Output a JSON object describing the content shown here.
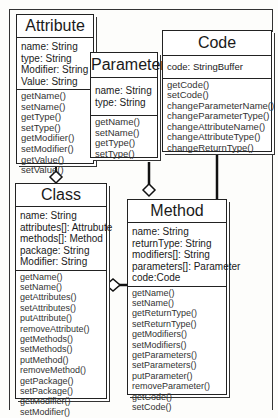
{
  "diagram": {
    "type": "uml-class-diagram",
    "classes": {
      "attribute": {
        "name": "Attribute",
        "attributes": [
          "name: String",
          "type: String",
          "Modifier: String",
          "Value: String"
        ],
        "operations": [
          "getName()",
          "setName()",
          "getType()",
          "setType()",
          "getModifier()",
          "setModifier()",
          "getValue()",
          "setValue()"
        ]
      },
      "parameter": {
        "name": "Parameter",
        "attributes": [
          "name: String",
          "type: String"
        ],
        "operations": [
          "getName()",
          "setName()",
          "getType()",
          "setType()"
        ]
      },
      "code": {
        "name": "Code",
        "attributes": [
          "code: StringBuffer"
        ],
        "operations": [
          "getCode()",
          "setCode()",
          "changeParameterName()",
          "changeParameterType()",
          "changeAttributeName()",
          "changeAttributeType()",
          "changeReturnType()"
        ]
      },
      "class": {
        "name": "Class",
        "attributes": [
          "name: String",
          "attributes[]: Attrubute",
          "methods[]: Method",
          "package: String",
          "Modifier: String"
        ],
        "operations": [
          "getName()",
          "setName()",
          "getAttributes()",
          "setAttributes()",
          "putAttribute()",
          "removeAttribute()",
          "getMethods()",
          "setMethods()",
          "putMethod()",
          "removeMethod()",
          "getPackage()",
          "setPackage()",
          "getModifier()",
          "setModifier()"
        ]
      },
      "method": {
        "name": "Method",
        "attributes": [
          "name: String",
          "returnType: String",
          "modifiers[]: String",
          "parameters[]: Parameter",
          "code:Code"
        ],
        "operations": [
          "getName()",
          "setName()",
          "getReturnType()",
          "setReturnType()",
          "getModifiers()",
          "setModifiers()",
          "getParameters()",
          "setParameters()",
          "putParameter()",
          "removeParameter()",
          "getCode()",
          "setCode()"
        ]
      }
    },
    "relations": [
      {
        "from": "Attribute",
        "to": "Class",
        "type": "aggregation"
      },
      {
        "from": "Parameter",
        "to": "Method",
        "type": "aggregation"
      },
      {
        "from": "Code",
        "to": "Method",
        "type": "association"
      },
      {
        "from": "Method",
        "to": "Class",
        "type": "aggregation"
      }
    ]
  }
}
